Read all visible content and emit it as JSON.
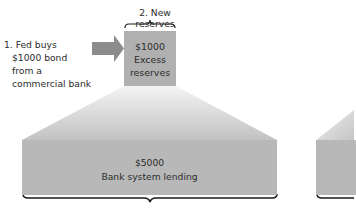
{
  "diagram": {
    "step1": {
      "lines": [
        "1. Fed buys",
        "$1000 bond",
        "from a",
        "commercial bank"
      ]
    },
    "step2": {
      "label": "2. New reserves"
    },
    "reserves_box": {
      "amount": "$1000",
      "line1": "Excess",
      "line2": "reserves"
    },
    "lending_box": {
      "amount": "$5000",
      "label": "Bank system lending"
    },
    "colors": {
      "box_small": "#b0b0b0",
      "box_large": "#b8b8b8",
      "arrow": "#8c8c8c",
      "brace": "#1a1a1a",
      "fan_light": "#f2f2f2",
      "fan_dark": "#c4c4c4"
    }
  }
}
